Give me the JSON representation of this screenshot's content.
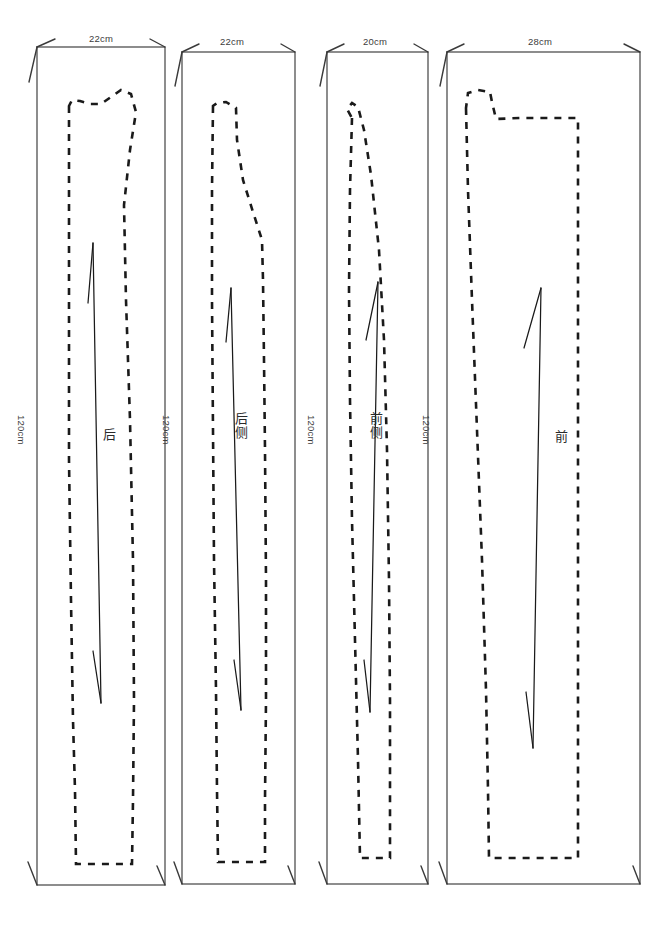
{
  "diagram": {
    "units": "cm",
    "line_styles": {
      "fabric_edge": "solid",
      "pattern_outline": "dashed",
      "grain_line": "double-arrow"
    },
    "colors": {
      "fabric_stroke": "#3a3a3a",
      "pattern_stroke": "#1a1a1a",
      "label_text": "#3c3c3c",
      "background": "#ffffff"
    }
  },
  "panels": [
    {
      "id": "panel-back",
      "piece_label": "后",
      "piece_label_meaning": "back",
      "width_label": "22cm",
      "height_label": "120cm",
      "width_cm": 22,
      "height_cm": 120,
      "rect": {
        "x": 37,
        "y": 47,
        "w": 128,
        "h": 838
      },
      "label_pos": {
        "x": 108,
        "y": 428
      },
      "width_label_pos": {
        "x": 101,
        "y": 33
      },
      "height_label_pos": {
        "x": 27,
        "y": 415
      }
    },
    {
      "id": "panel-back-side",
      "piece_label": "后侧",
      "piece_label_meaning": "back side",
      "width_label": "22cm",
      "height_label": "120cm",
      "width_cm": 22,
      "height_cm": 120,
      "rect": {
        "x": 182,
        "y": 52,
        "w": 113,
        "h": 832
      },
      "label_pos": {
        "x": 240,
        "y": 420
      },
      "width_label_pos": {
        "x": 232,
        "y": 36
      },
      "height_label_pos": {
        "x": 172,
        "y": 415
      }
    },
    {
      "id": "panel-front-side",
      "piece_label": "前侧",
      "piece_label_meaning": "front side",
      "width_label": "20cm",
      "height_label": "120cm",
      "width_cm": 20,
      "height_cm": 120,
      "rect": {
        "x": 327,
        "y": 52,
        "w": 101,
        "h": 832
      },
      "label_pos": {
        "x": 375,
        "y": 420
      },
      "width_label_pos": {
        "x": 375,
        "y": 36
      },
      "height_label_pos": {
        "x": 317,
        "y": 415
      }
    },
    {
      "id": "panel-front",
      "piece_label": "前",
      "piece_label_meaning": "front",
      "width_label": "28cm",
      "height_label": "120cm",
      "width_cm": 28,
      "height_cm": 120,
      "rect": {
        "x": 447,
        "y": 52,
        "w": 193,
        "h": 832
      },
      "label_pos": {
        "x": 560,
        "y": 430
      },
      "width_label_pos": {
        "x": 540,
        "y": 36
      },
      "height_label_pos": {
        "x": 432,
        "y": 415
      }
    }
  ]
}
